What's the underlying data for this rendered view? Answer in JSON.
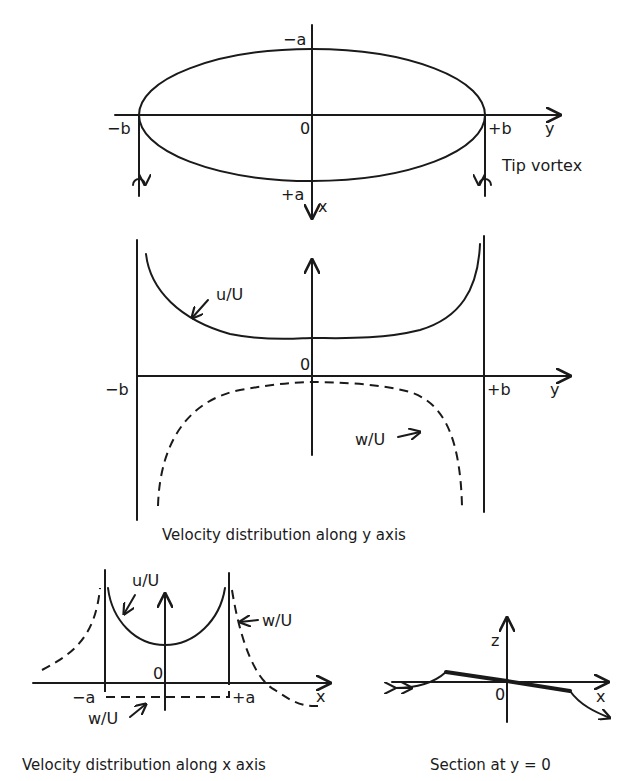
{
  "planform": {
    "labels": {
      "minus_a": "−a",
      "plus_a": "+a",
      "minus_b": "−b",
      "plus_b": "+b",
      "origin": "0",
      "y_axis": "y",
      "x_axis": "x",
      "tip_vortex": "Tip vortex"
    }
  },
  "y_distribution": {
    "labels": {
      "origin": "0",
      "minus_b": "−b",
      "plus_b": "+b",
      "y_axis": "y",
      "u_curve": "u/U",
      "w_curve": "w/U"
    },
    "caption": "Velocity distribution along y axis"
  },
  "x_distribution": {
    "labels": {
      "origin": "0",
      "minus_a": "−a",
      "plus_a": "+a",
      "x_axis": "x",
      "u_curve": "u/U",
      "w_curve_right": "w/U",
      "w_curve_bottom": "w/U"
    },
    "caption": "Velocity distribution along x axis"
  },
  "section": {
    "labels": {
      "z_axis": "z",
      "x_axis": "x",
      "origin": "0"
    },
    "caption": "Section at y = 0"
  }
}
